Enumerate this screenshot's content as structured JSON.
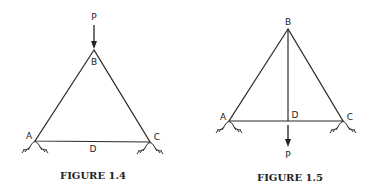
{
  "figures": [
    {
      "caption": "FIGURE 1.4",
      "labels": {
        "load": "P",
        "apex": "B",
        "left": "A",
        "right": "C",
        "mid": "D"
      },
      "load_direction": "down-onto-apex"
    },
    {
      "caption": "FIGURE 1.5",
      "labels": {
        "load": "P",
        "apex": "B",
        "left": "A",
        "right": "C",
        "mid": "D"
      },
      "load_direction": "down-from-midspan"
    }
  ]
}
